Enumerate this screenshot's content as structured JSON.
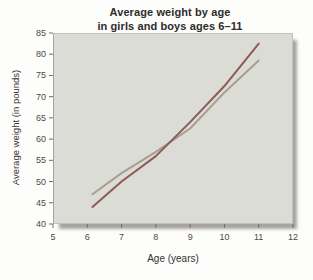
{
  "chart": {
    "title_line1": "Average weight by age",
    "title_line2": "in girls and boys ages 6–11",
    "xlabel": "Age (years)",
    "ylabel": "Average weight (in pounds)"
  },
  "chart_data": {
    "type": "line",
    "title": "Average weight by age in girls and boys ages 6–11",
    "xlabel": "Age (years)",
    "ylabel": "Average weight (in pounds)",
    "x": [
      6,
      7,
      8,
      9,
      10,
      11
    ],
    "series": [
      {
        "name": "tan-line",
        "color": "#a89e90",
        "values": [
          47,
          52,
          57,
          62.5,
          71,
          78.5
        ]
      },
      {
        "name": "dark-red-line",
        "color": "#8d5a55",
        "values": [
          44,
          50,
          56,
          64,
          72.5,
          82.5
        ]
      }
    ],
    "xlim": [
      5,
      12
    ],
    "ylim": [
      40,
      85
    ],
    "x_ticks": [
      5,
      6,
      7,
      8,
      9,
      10,
      11,
      12
    ],
    "y_ticks": [
      40,
      45,
      50,
      55,
      60,
      65,
      70,
      75,
      80,
      85
    ],
    "grid": false,
    "legend": "none",
    "first_point_x_offset": 0.15
  },
  "colors": {
    "plot_bg": "#dcdcd6",
    "line_red": "#8d5a55",
    "line_tan": "#a89e90",
    "tick": "#6f6e69",
    "tick_label": "#4c4a46",
    "title": "#2e2c29"
  }
}
